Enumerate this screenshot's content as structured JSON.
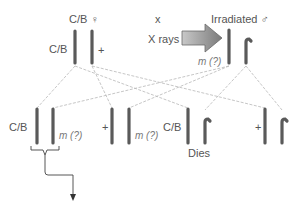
{
  "diagram": {
    "parents": {
      "female": {
        "symbol_label": "C/B ♀",
        "left_chromosome_label": "C/B",
        "right_chromosome_label": "+"
      },
      "cross_symbol": "x",
      "male": {
        "symbol_label": "Irradiated ♂",
        "treatment_label": "X rays",
        "x_chromosome_label": "m (?)"
      }
    },
    "offspring": [
      {
        "left_label": "C/B",
        "right_label": "m (?)",
        "fate": ""
      },
      {
        "left_label": "+",
        "right_label": "m (?)",
        "fate": ""
      },
      {
        "left_label": "C/B",
        "right_label": "",
        "fate": "Dies"
      },
      {
        "left_label": "+",
        "right_label": "",
        "fate": ""
      }
    ],
    "colors": {
      "chromosome": "#5a5a5a",
      "cross_lines": "#b5b5b5",
      "arrow_fill": "#8f8f8f",
      "text": "#555555"
    }
  }
}
